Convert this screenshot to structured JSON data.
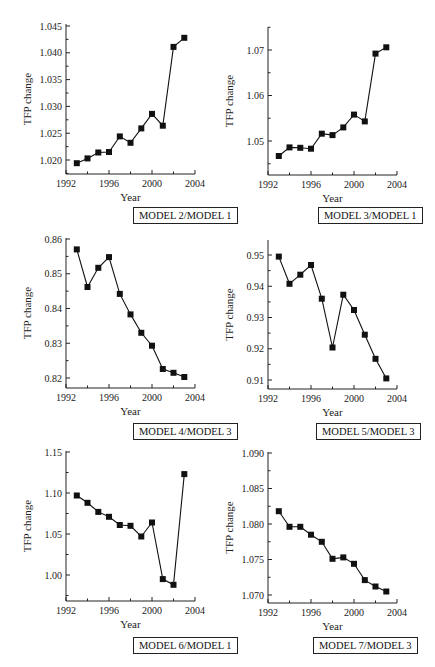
{
  "chart_data": [
    {
      "type": "line",
      "title": "MODEL 2/MODEL 1",
      "xlabel": "Year",
      "ylabel": "TFP change",
      "x": [
        1993,
        1994,
        1995,
        1996,
        1997,
        1998,
        1999,
        2000,
        2001,
        2002,
        2003
      ],
      "series": [
        {
          "name": "MODEL 2/MODEL 1",
          "values": [
            1.0194,
            1.0203,
            1.0214,
            1.0215,
            1.0244,
            1.0232,
            1.0259,
            1.0286,
            1.0264,
            1.0411,
            1.0428
          ]
        }
      ],
      "xlim": [
        1992,
        2004
      ],
      "ylim": [
        1.0175,
        1.045
      ],
      "xticks": [
        1992,
        1996,
        2000,
        2004
      ],
      "yticks": [
        1.02,
        1.025,
        1.03,
        1.035,
        1.04,
        1.045
      ],
      "ytick_labels": [
        "1.020",
        "1.025",
        "1.030",
        "1.035",
        "1.040",
        "1.045"
      ],
      "frame": {
        "x0": 66,
        "x1": 195,
        "ytop_val": 1.045,
        "ytop_px": 26,
        "ybot_val": 1.02,
        "ybot_px": 160,
        "axis_bottom_px": 174,
        "axis_top_px": 24
      },
      "grid": false
    },
    {
      "type": "line",
      "title": "MODEL 3/MODEL 1",
      "xlabel": "Year",
      "ylabel": "TFP change",
      "x": [
        1993,
        1994,
        1995,
        1996,
        1997,
        1998,
        1999,
        2000,
        2001,
        2002,
        2003
      ],
      "series": [
        {
          "name": "MODEL 3/MODEL 1",
          "values": [
            1.0467,
            1.0486,
            1.0485,
            1.0483,
            1.0516,
            1.0513,
            1.053,
            1.0558,
            1.0543,
            1.0692,
            1.0706
          ]
        }
      ],
      "xlim": [
        1992,
        2004
      ],
      "ylim": [
        1.0425,
        1.0745
      ],
      "xticks": [
        1992,
        1996,
        2000,
        2004
      ],
      "yticks": [
        1.05,
        1.06,
        1.07
      ],
      "ytick_labels": [
        "1.05",
        "1.06",
        "1.07"
      ],
      "frame": {
        "x0": 268,
        "x1": 397,
        "ytop_val": 1.07,
        "ytop_px": 50,
        "ybot_val": 1.05,
        "ybot_px": 141,
        "axis_bottom_px": 175,
        "axis_top_px": 27
      },
      "grid": false
    },
    {
      "type": "line",
      "title": "MODEL 4/MODEL 3",
      "xlabel": "Year",
      "ylabel": "TFP change",
      "x": [
        1993,
        1994,
        1995,
        1996,
        1997,
        1998,
        1999,
        2000,
        2001,
        2002,
        2003
      ],
      "series": [
        {
          "name": "MODEL 4/MODEL 3",
          "values": [
            0.857,
            0.8462,
            0.8517,
            0.8548,
            0.8442,
            0.8383,
            0.833,
            0.8293,
            0.8226,
            0.8215,
            0.8203
          ]
        }
      ],
      "xlim": [
        1992,
        2004
      ],
      "ylim": [
        0.8175,
        0.86
      ],
      "xticks": [
        1992,
        1996,
        2000,
        2004
      ],
      "yticks": [
        0.82,
        0.83,
        0.84,
        0.85,
        0.86
      ],
      "ytick_labels": [
        "0.82",
        "0.83",
        "0.84",
        "0.85",
        "0.86"
      ],
      "frame": {
        "x0": 66,
        "x1": 195,
        "ytop_val": 0.86,
        "ytop_px": 239,
        "ybot_val": 0.82,
        "ybot_px": 378,
        "axis_bottom_px": 388,
        "axis_top_px": 238
      },
      "grid": false
    },
    {
      "type": "line",
      "title": "MODEL 5/MODEL 3",
      "xlabel": "Year",
      "ylabel": "TFP change",
      "x": [
        1993,
        1994,
        1995,
        1996,
        1997,
        1998,
        1999,
        2000,
        2001,
        2002,
        2003
      ],
      "series": [
        {
          "name": "MODEL 5/MODEL 3",
          "values": [
            0.9495,
            0.9408,
            0.9437,
            0.9468,
            0.936,
            0.9204,
            0.9373,
            0.9324,
            0.9245,
            0.9168,
            0.9105
          ]
        }
      ],
      "xlim": [
        1992,
        2004
      ],
      "ylim": [
        0.907,
        0.9545
      ],
      "xticks": [
        1992,
        1996,
        2000,
        2004
      ],
      "yticks": [
        0.91,
        0.92,
        0.93,
        0.94,
        0.95
      ],
      "ytick_labels": [
        "0.91",
        "0.92",
        "0.93",
        "0.94",
        "0.95"
      ],
      "frame": {
        "x0": 268,
        "x1": 397,
        "ytop_val": 0.95,
        "ytop_px": 255,
        "ybot_val": 0.91,
        "ybot_px": 380,
        "axis_bottom_px": 389,
        "axis_top_px": 240
      },
      "grid": false
    },
    {
      "type": "line",
      "title": "MODEL 6/MODEL 1",
      "xlabel": "Year",
      "ylabel": "TFP change",
      "x": [
        1993,
        1994,
        1995,
        1996,
        1997,
        1998,
        1999,
        2000,
        2001,
        2002,
        2003
      ],
      "series": [
        {
          "name": "MODEL 6/MODEL 1",
          "values": [
            1.097,
            1.088,
            1.077,
            1.071,
            1.061,
            1.06,
            1.047,
            1.064,
            0.995,
            0.988,
            1.123
          ]
        }
      ],
      "xlim": [
        1992,
        2004
      ],
      "ylim": [
        0.97,
        1.15
      ],
      "xticks": [
        1992,
        1996,
        2000,
        2004
      ],
      "yticks": [
        1.0,
        1.05,
        1.1,
        1.15
      ],
      "ytick_labels": [
        "1.00",
        "1.05",
        "1.10",
        "1.15"
      ],
      "frame": {
        "x0": 66,
        "x1": 195,
        "ytop_val": 1.15,
        "ytop_px": 452,
        "ybot_val": 1.0,
        "ybot_px": 575,
        "axis_bottom_px": 601,
        "axis_top_px": 451
      },
      "grid": false
    },
    {
      "type": "line",
      "title": "MODEL 7/MODEL 3",
      "xlabel": "Year",
      "ylabel": "TFP change",
      "x": [
        1993,
        1994,
        1995,
        1996,
        1997,
        1998,
        1999,
        2000,
        2001,
        2002,
        2003
      ],
      "series": [
        {
          "name": "MODEL 7/MODEL 3",
          "values": [
            1.0818,
            1.0796,
            1.0796,
            1.0785,
            1.0775,
            1.0751,
            1.0753,
            1.0744,
            1.0721,
            1.0712,
            1.0705
          ]
        }
      ],
      "xlim": [
        1992,
        2004
      ],
      "ylim": [
        1.069,
        1.09
      ],
      "xticks": [
        1992,
        1996,
        2000,
        2004
      ],
      "yticks": [
        1.07,
        1.075,
        1.08,
        1.085,
        1.09
      ],
      "ytick_labels": [
        "1.070",
        "1.075",
        "1.080",
        "1.085",
        "1.090"
      ],
      "frame": {
        "x0": 268,
        "x1": 397,
        "ytop_val": 1.09,
        "ytop_px": 453,
        "ybot_val": 1.07,
        "ybot_px": 595,
        "axis_bottom_px": 603,
        "axis_top_px": 452
      },
      "grid": false
    }
  ],
  "labels": {
    "box_1": "MODEL 2/MODEL 1",
    "box_2": "MODEL 3/MODEL 1",
    "box_3": "MODEL 4/MODEL 3",
    "box_4": "MODEL 5/MODEL 3",
    "box_5": "MODEL 6/MODEL 1",
    "box_6": "MODEL 7/MODEL 3"
  },
  "colors": {
    "line": "#111111",
    "marker": "#111111",
    "axis": "#222222"
  }
}
